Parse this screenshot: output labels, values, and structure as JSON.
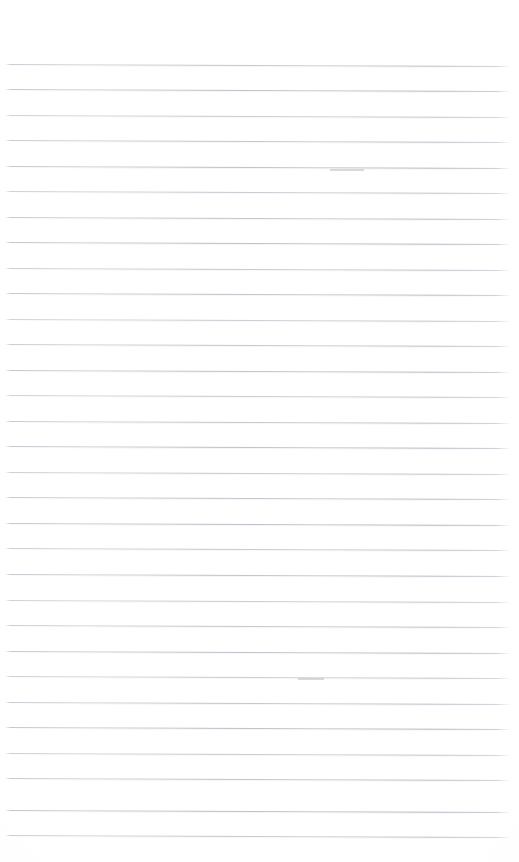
{
  "document": {
    "type": "blank-lined-notepad-page",
    "title": "Blank ruled notepad page",
    "description": "Scanned blank page of lined writing paper with no handwriting or printed text",
    "page_width": 519,
    "page_height": 862,
    "background_color": "#ffffff",
    "rule_color": "#b4b9c1",
    "has_margin_rule": false,
    "has_header": false,
    "has_footer": false,
    "has_page_number": false,
    "text_content": "",
    "ruling": {
      "line_count": 31,
      "first_line_y": 64,
      "last_line_y": 835,
      "line_spacing": 25.7,
      "line_thickness": 1,
      "line_start_x": 5,
      "line_end_x": 511,
      "slope_px": 2,
      "top_margin": 64,
      "bottom_margin": 27,
      "left_margin": 5,
      "right_margin": 8
    },
    "lines": [
      {
        "index": 1,
        "y": 64
      },
      {
        "index": 2,
        "y": 89
      },
      {
        "index": 3,
        "y": 115
      },
      {
        "index": 4,
        "y": 140
      },
      {
        "index": 5,
        "y": 166
      },
      {
        "index": 6,
        "y": 191
      },
      {
        "index": 7,
        "y": 217
      },
      {
        "index": 8,
        "y": 242
      },
      {
        "index": 9,
        "y": 268
      },
      {
        "index": 10,
        "y": 293
      },
      {
        "index": 11,
        "y": 319
      },
      {
        "index": 12,
        "y": 344
      },
      {
        "index": 13,
        "y": 370
      },
      {
        "index": 14,
        "y": 395
      },
      {
        "index": 15,
        "y": 421
      },
      {
        "index": 16,
        "y": 446
      },
      {
        "index": 17,
        "y": 472
      },
      {
        "index": 18,
        "y": 497
      },
      {
        "index": 19,
        "y": 523
      },
      {
        "index": 20,
        "y": 548
      },
      {
        "index": 21,
        "y": 574
      },
      {
        "index": 22,
        "y": 600
      },
      {
        "index": 23,
        "y": 625
      },
      {
        "index": 24,
        "y": 651
      },
      {
        "index": 25,
        "y": 676
      },
      {
        "index": 26,
        "y": 702
      },
      {
        "index": 27,
        "y": 727
      },
      {
        "index": 28,
        "y": 753
      },
      {
        "index": 29,
        "y": 778
      },
      {
        "index": 30,
        "y": 810
      },
      {
        "index": 31,
        "y": 835
      }
    ],
    "blemishes": [
      {
        "name": "scan-nick-upper-right",
        "x": 330,
        "y": 169,
        "width": 34,
        "height": 2
      },
      {
        "name": "scan-nick-mid-right",
        "x": 298,
        "y": 678,
        "width": 26,
        "height": 2
      }
    ]
  }
}
